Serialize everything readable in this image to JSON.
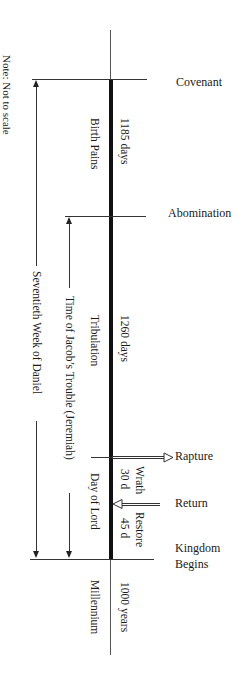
{
  "note": "Note: Not to scale",
  "events": {
    "covenant": "Covenant",
    "abomination": "Abomination",
    "rapture": "Rapture",
    "return": "Return",
    "kingdom_line1": "Kingdom",
    "kingdom_line2": "Begins"
  },
  "periods": {
    "birth_pains": "Birth Pains",
    "birth_pains_days": "1185 days",
    "tribulation": "Tribulation",
    "tribulation_days": "1260 days",
    "day_of_lord": "Day of Lord",
    "wrath": "Wrath",
    "wrath_days": "30 d",
    "restore": "Restore",
    "restore_days": "45 d",
    "millennium": "Millennium",
    "millennium_years": "1000 years"
  },
  "spans": {
    "seventieth_week": "Seventieth Week of Daniel",
    "jacobs_trouble": "Time of Jacob’s Trouble (Jeremiah)"
  },
  "colors": {
    "line": "#333333",
    "thick_bar": "#111111",
    "text": "#1a1a1a"
  }
}
